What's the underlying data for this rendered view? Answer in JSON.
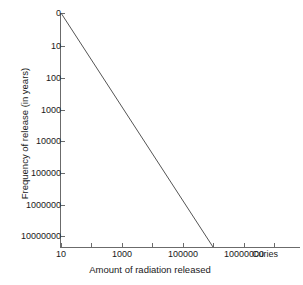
{
  "chart_data": {
    "type": "line",
    "title": "",
    "subtitle": "",
    "xlabel": "Amount of radiation released",
    "ylabel": "Frequency of release (in years)",
    "x_unit": "Curies",
    "x_scale": "log",
    "y_scale": "log-descending",
    "grid": false,
    "legend": null,
    "x_ticks": [
      "10",
      "1000",
      "100000",
      "10000000"
    ],
    "x_tick_values": [
      10,
      1000,
      100000,
      10000000
    ],
    "y_ticks": [
      "0",
      "10",
      "100",
      "1000",
      "10000",
      "100000",
      "1000000",
      "10000000"
    ],
    "y_tick_values": [
      0,
      10,
      100,
      1000,
      10000,
      100000,
      1000000,
      10000000
    ],
    "xlim": [
      10,
      10000000
    ],
    "ylim": [
      0,
      10000000
    ],
    "series": [
      {
        "name": "release frequency",
        "color": "#555555",
        "x": [
          10,
          1000000
        ],
        "y": [
          0,
          10000000
        ],
        "points": [
          {
            "x": 10,
            "y": 0
          },
          {
            "x": 100,
            "y": 100
          },
          {
            "x": 1000,
            "y": 1000
          },
          {
            "x": 10000,
            "y": 50000
          },
          {
            "x": 100000,
            "y": 500000
          },
          {
            "x": 1000000,
            "y": 10000000
          }
        ]
      }
    ],
    "annotations": []
  },
  "axes": {
    "y_tick_labels": [
      {
        "label": "0",
        "y": 13
      },
      {
        "label": "10",
        "y": 46
      },
      {
        "label": "100",
        "y": 78
      },
      {
        "label": "1000",
        "y": 110
      },
      {
        "label": "10000",
        "y": 141
      },
      {
        "label": "100000",
        "y": 173
      },
      {
        "label": "1000000",
        "y": 205
      },
      {
        "label": "10000000",
        "y": 236
      }
    ],
    "x_tick_labels": [
      {
        "label": "10",
        "x": 61
      },
      {
        "label": "1000",
        "x": 122
      },
      {
        "label": "100000",
        "x": 183
      },
      {
        "label": "10000000",
        "x": 244
      }
    ],
    "x_minor_ticks": [
      61,
      91,
      122,
      152,
      183,
      213,
      244,
      274
    ],
    "axis_color": "#6b6b6b",
    "line_color": "#555555"
  },
  "plot_line": {
    "start_x": 61,
    "start_y": 13,
    "end_x": 213,
    "end_y": 247
  }
}
